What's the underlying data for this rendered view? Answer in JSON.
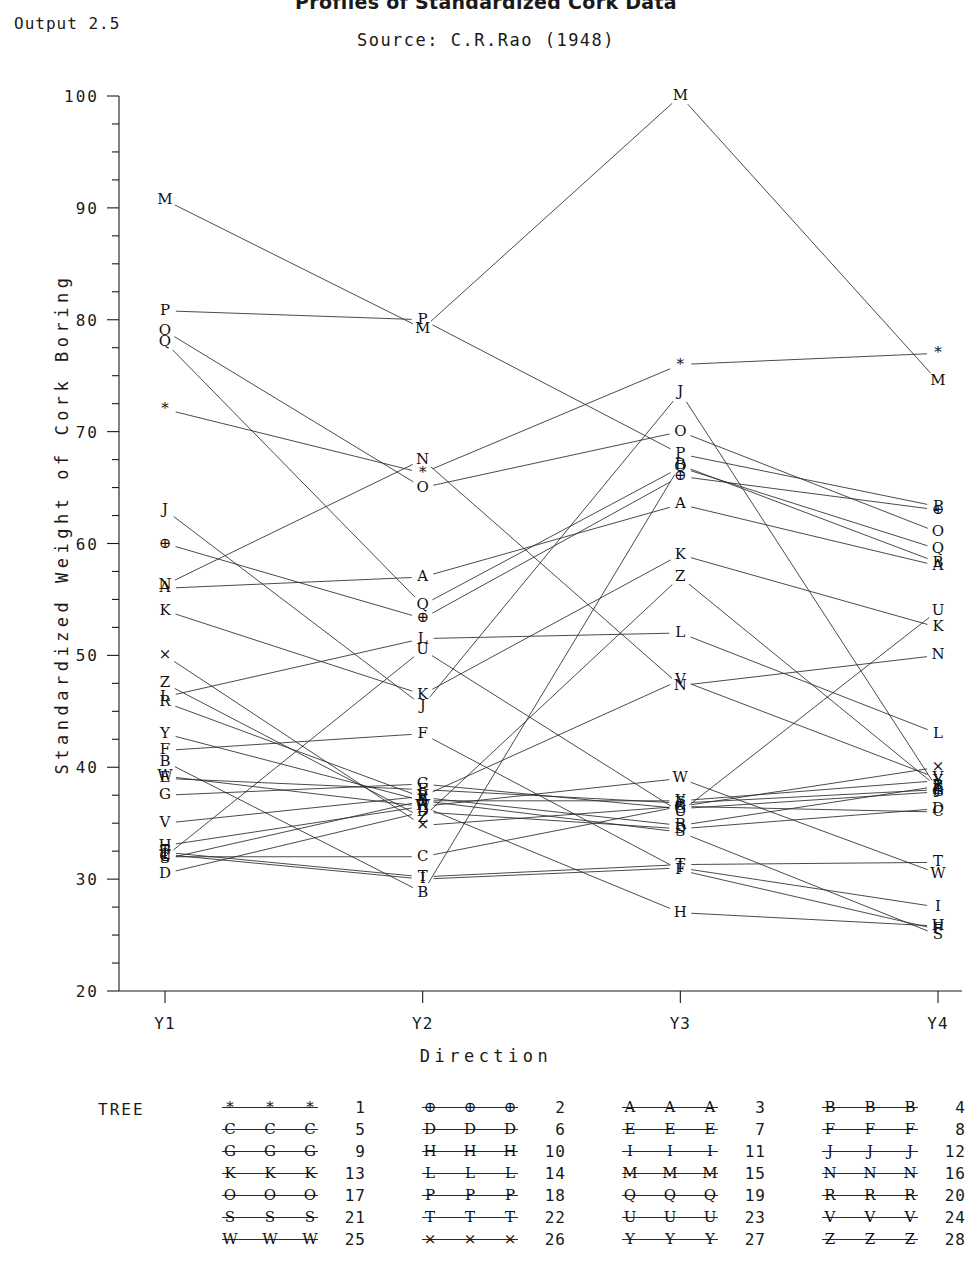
{
  "header": {
    "title": "Profiles of Standardized Cork Data",
    "output_tag": "Output 2.5",
    "subtitle": "Source: C.R.Rao (1948)"
  },
  "axes": {
    "ylabel": "Standardized Weight of Cork Boring",
    "xlabel": "Direction",
    "yticks": [
      "20",
      "30",
      "40",
      "50",
      "60",
      "70",
      "80",
      "90",
      "100"
    ],
    "xticks": [
      "Y1",
      "Y2",
      "Y3",
      "Y4"
    ],
    "ymin": 20,
    "ymax": 100,
    "minor_tick_step": 2.5
  },
  "legend": {
    "title": "TREE",
    "entries": [
      {
        "num": "1",
        "glyph": "*"
      },
      {
        "num": "2",
        "glyph": "⊕"
      },
      {
        "num": "3",
        "glyph": "A"
      },
      {
        "num": "4",
        "glyph": "B"
      },
      {
        "num": "5",
        "glyph": "C"
      },
      {
        "num": "6",
        "glyph": "D"
      },
      {
        "num": "7",
        "glyph": "E"
      },
      {
        "num": "8",
        "glyph": "F"
      },
      {
        "num": "9",
        "glyph": "G"
      },
      {
        "num": "10",
        "glyph": "H"
      },
      {
        "num": "11",
        "glyph": "I"
      },
      {
        "num": "12",
        "glyph": "J"
      },
      {
        "num": "13",
        "glyph": "K"
      },
      {
        "num": "14",
        "glyph": "L"
      },
      {
        "num": "15",
        "glyph": "M"
      },
      {
        "num": "16",
        "glyph": "N"
      },
      {
        "num": "17",
        "glyph": "O"
      },
      {
        "num": "18",
        "glyph": "P"
      },
      {
        "num": "19",
        "glyph": "Q"
      },
      {
        "num": "20",
        "glyph": "R"
      },
      {
        "num": "21",
        "glyph": "S"
      },
      {
        "num": "22",
        "glyph": "T"
      },
      {
        "num": "23",
        "glyph": "U"
      },
      {
        "num": "24",
        "glyph": "V"
      },
      {
        "num": "25",
        "glyph": "W"
      },
      {
        "num": "26",
        "glyph": "×"
      },
      {
        "num": "27",
        "glyph": "Y"
      },
      {
        "num": "28",
        "glyph": "Z"
      }
    ]
  },
  "chart_data": {
    "type": "line",
    "title": "Profiles of Standardized Cork Data",
    "subtitle": "Source: C.R.Rao (1948)",
    "xlabel": "Direction",
    "ylabel": "Standardized Weight of Cork Boring",
    "categories": [
      "Y1",
      "Y2",
      "Y3",
      "Y4"
    ],
    "ylim": [
      20,
      100
    ],
    "grid": false,
    "legend_position": "bottom",
    "series": [
      {
        "name": "1",
        "glyph": "*",
        "values": [
          72.0,
          66.3,
          76.0,
          77.0
        ]
      },
      {
        "name": "2",
        "glyph": "⊕",
        "values": [
          60.0,
          53.3,
          66.0,
          63.0
        ]
      },
      {
        "name": "3",
        "glyph": "A",
        "values": [
          56.0,
          57.0,
          63.5,
          58.0
        ]
      },
      {
        "name": "4",
        "glyph": "B",
        "values": [
          40.5,
          28.8,
          67.0,
          58.3
        ]
      },
      {
        "name": "5",
        "glyph": "C",
        "values": [
          32.0,
          32.0,
          36.5,
          36.0
        ]
      },
      {
        "name": "6",
        "glyph": "D",
        "values": [
          30.5,
          36.0,
          34.5,
          36.3
        ]
      },
      {
        "name": "7",
        "glyph": "E",
        "values": [
          39.0,
          38.0,
          36.8,
          38.0
        ]
      },
      {
        "name": "8",
        "glyph": "F",
        "values": [
          41.5,
          43.0,
          30.8,
          25.5
        ]
      },
      {
        "name": "9",
        "glyph": "G",
        "values": [
          37.5,
          38.5,
          36.3,
          37.8
        ]
      },
      {
        "name": "10",
        "glyph": "H",
        "values": [
          33.0,
          36.5,
          27.0,
          25.8
        ]
      },
      {
        "name": "11",
        "glyph": "I",
        "values": [
          32.2,
          30.0,
          31.0,
          27.5
        ]
      },
      {
        "name": "12",
        "glyph": "J",
        "values": [
          63.0,
          45.5,
          73.5,
          38.0
        ]
      },
      {
        "name": "13",
        "glyph": "K",
        "values": [
          54.0,
          46.5,
          59.0,
          52.5
        ]
      },
      {
        "name": "14",
        "glyph": "L",
        "values": [
          46.3,
          51.5,
          52.0,
          43.0
        ]
      },
      {
        "name": "15",
        "glyph": "M",
        "values": [
          90.7,
          79.2,
          100.0,
          74.5
        ]
      },
      {
        "name": "16",
        "glyph": "N",
        "values": [
          56.3,
          67.5,
          47.3,
          50.0
        ]
      },
      {
        "name": "17",
        "glyph": "O",
        "values": [
          79.0,
          65.0,
          70.0,
          61.0
        ]
      },
      {
        "name": "18",
        "glyph": "P",
        "values": [
          80.8,
          80.0,
          68.0,
          63.3
        ]
      },
      {
        "name": "19",
        "glyph": "Q",
        "values": [
          78.0,
          54.5,
          66.8,
          59.5
        ]
      },
      {
        "name": "20",
        "glyph": "R",
        "values": [
          45.8,
          37.3,
          34.8,
          38.3
        ]
      },
      {
        "name": "21",
        "glyph": "S",
        "values": [
          31.8,
          37.0,
          34.2,
          25.0
        ]
      },
      {
        "name": "22",
        "glyph": "T",
        "values": [
          32.4,
          30.2,
          31.3,
          31.5
        ]
      },
      {
        "name": "23",
        "glyph": "U",
        "values": [
          32.0,
          50.5,
          36.0,
          54.0
        ]
      },
      {
        "name": "24",
        "glyph": "V",
        "values": [
          35.0,
          37.4,
          47.8,
          39.0
        ]
      },
      {
        "name": "25",
        "glyph": "W",
        "values": [
          39.2,
          36.5,
          39.0,
          30.5
        ]
      },
      {
        "name": "26",
        "glyph": "×",
        "values": [
          50.0,
          34.8,
          36.5,
          40.0
        ]
      },
      {
        "name": "27",
        "glyph": "Y",
        "values": [
          43.0,
          37.0,
          37.0,
          38.8
        ]
      },
      {
        "name": "28",
        "glyph": "Z",
        "values": [
          47.5,
          35.5,
          57.0,
          38.2
        ]
      }
    ]
  }
}
